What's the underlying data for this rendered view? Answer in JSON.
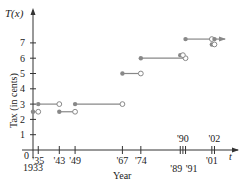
{
  "chart_data": {
    "type": "line",
    "subtype": "step-function",
    "title": "",
    "xlabel": "Year",
    "ylabel": "Tax (in cents)",
    "y_axis_title": "T(x)",
    "x_axis_var": "t",
    "origin_label": "0",
    "origin_year_label": "1933",
    "xlim": [
      1933,
      2006
    ],
    "ylim": [
      0,
      8
    ],
    "grid": false,
    "legend": null,
    "y_ticks": [
      1,
      2,
      3,
      4,
      5,
      6,
      7
    ],
    "x_ticks_below": [
      {
        "year": 1935,
        "label": "'35"
      },
      {
        "year": 1943,
        "label": "'43"
      },
      {
        "year": 1949,
        "label": "'49"
      },
      {
        "year": 1967,
        "label": "'67"
      },
      {
        "year": 1974,
        "label": "'74"
      },
      {
        "year": 1989,
        "label": "'89"
      },
      {
        "year": 1991,
        "label": "'91"
      },
      {
        "year": 2001,
        "label": "'01"
      }
    ],
    "x_ticks_above": [
      {
        "year": 1990,
        "label": "'90"
      },
      {
        "year": 2002,
        "label": "'02"
      }
    ],
    "segments": [
      {
        "x0": 1933,
        "x1": 1935,
        "y": 2.5,
        "start": "closed",
        "end": "open"
      },
      {
        "x0": 1935,
        "x1": 1943,
        "y": 3,
        "start": "closed",
        "end": "open"
      },
      {
        "x0": 1943,
        "x1": 1949,
        "y": 2.5,
        "start": "closed",
        "end": "open"
      },
      {
        "x0": 1949,
        "x1": 1967,
        "y": 3,
        "start": "closed",
        "end": "open"
      },
      {
        "x0": 1967,
        "x1": 1974,
        "y": 5,
        "start": "closed",
        "end": "open"
      },
      {
        "x0": 1974,
        "x1": 1991,
        "y": 6,
        "start": "closed",
        "end": "open"
      },
      {
        "x0": 1989,
        "x1": 1990,
        "y": 6.2,
        "start": "closed",
        "end": "open"
      },
      {
        "x0": 1991,
        "x1": 2001,
        "y": 7.25,
        "start": "closed",
        "end": "open"
      },
      {
        "x0": 2001,
        "x1": 2002,
        "y": 6.9,
        "start": "closed",
        "end": "open"
      },
      {
        "x0": 2002,
        "x1": 2006,
        "y": 7.25,
        "start": "closed",
        "end": "arrow"
      }
    ]
  },
  "labels": {
    "y_title": "T(x)",
    "y_axis": "Tax (in cents)",
    "x_axis": "Year",
    "x_var": "t",
    "origin": "0",
    "origin_year": "1933"
  }
}
